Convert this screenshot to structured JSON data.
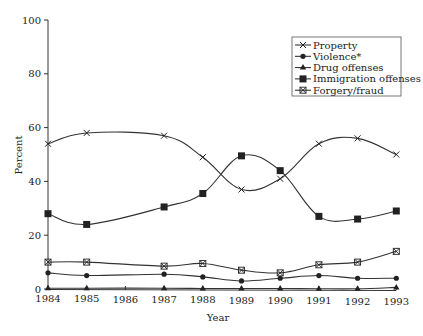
{
  "chart_data": {
    "type": "line",
    "title": "",
    "xlabel": "Year",
    "ylabel": "Percent",
    "ylim": [
      0,
      100
    ],
    "yticks": [
      0,
      20,
      40,
      60,
      80,
      100
    ],
    "x_tick_labels": [
      "1984",
      "1985",
      "1986",
      "1987",
      "1988",
      "1989",
      "1990",
      "1991",
      "1992",
      "1993"
    ],
    "x": [
      1984,
      1985,
      1987,
      1988,
      1989,
      1990,
      1991,
      1992,
      1993
    ],
    "grid": false,
    "legend_position": "upper right",
    "series": [
      {
        "name": "Property",
        "marker": "x",
        "values": [
          54,
          58,
          57,
          49,
          37,
          41,
          54,
          56,
          50
        ]
      },
      {
        "name": "Violence*",
        "marker": "circle",
        "values": [
          6,
          5,
          5.5,
          4.5,
          3,
          4,
          5,
          4,
          4
        ]
      },
      {
        "name": "Drug offenses",
        "marker": "triangle",
        "values": [
          0.3,
          0.3,
          0.3,
          0.2,
          0.2,
          0.2,
          0.1,
          0.1,
          0.6
        ]
      },
      {
        "name": "Immigration offenses",
        "marker": "square",
        "values": [
          28,
          24,
          30.5,
          35.5,
          49.5,
          44,
          27,
          26,
          29
        ]
      },
      {
        "name": "Forgery/fraud",
        "marker": "asterisk-box",
        "values": [
          10,
          10,
          8.5,
          9.5,
          7,
          6,
          9,
          10,
          14
        ]
      }
    ]
  }
}
